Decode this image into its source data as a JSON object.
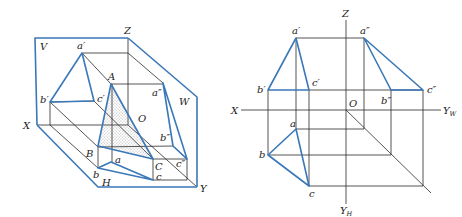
{
  "figure": {
    "left_view": {
      "title": "Pictorial view of triangle ABC projected onto V, H, W planes",
      "plane_labels": {
        "V": "V",
        "H": "H",
        "W": "W"
      },
      "axis_labels": {
        "X": "X",
        "Y": "Y",
        "Z": "Z",
        "O": "O"
      },
      "point_labels": {
        "A": "A",
        "B": "B",
        "C": "C",
        "a": "a",
        "b": "b",
        "c": "c",
        "a_prime": "a′",
        "b_prime": "b′",
        "c_prime": "c′",
        "a_dprime": "a″",
        "b_dprime": "b″",
        "c_dprime": "c″"
      }
    },
    "right_view": {
      "title": "Three-view orthographic projection of triangle ABC",
      "axis_labels": {
        "X": "X",
        "Z": "Z",
        "O": "O",
        "YW_main": "Y",
        "YW_sub": "W",
        "YH_main": "Y",
        "YH_sub": "H"
      },
      "point_labels": {
        "a": "a",
        "b": "b",
        "c": "c",
        "a_prime": "a′",
        "b_prime": "b′",
        "c_prime": "c′",
        "a_dprime": "a″",
        "b_dprime": "b″",
        "c_dprime": "c″"
      }
    },
    "colors": {
      "plane_and_object": "#3a78b8",
      "construction": "#2a2a2a",
      "stipple": "#555555"
    }
  }
}
